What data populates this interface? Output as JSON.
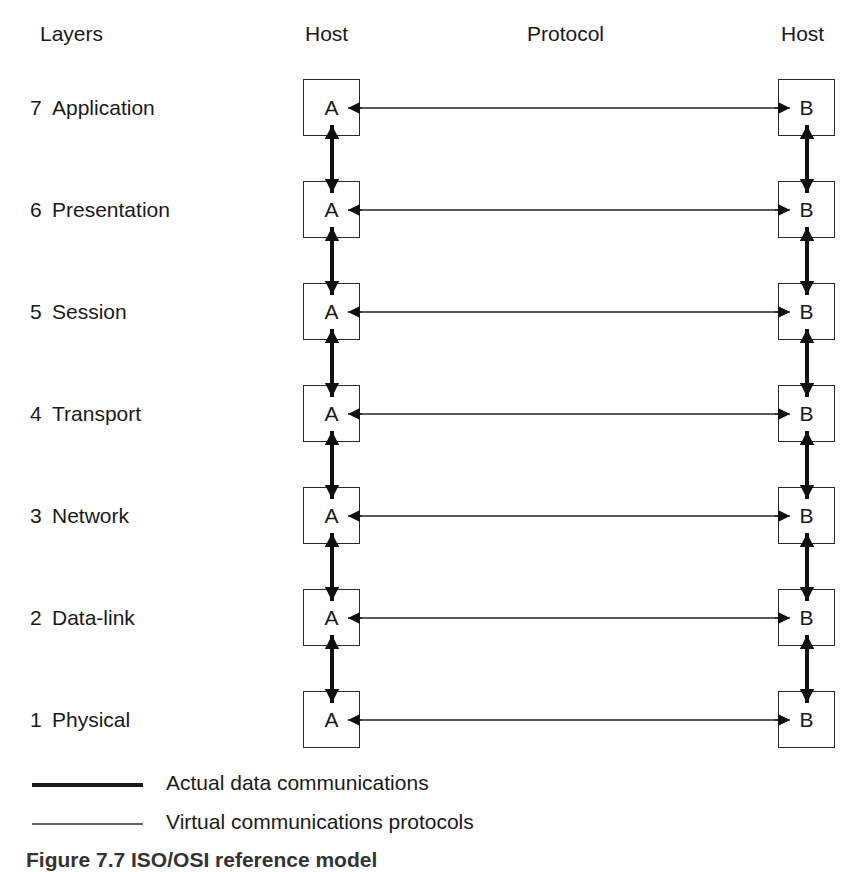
{
  "headers": {
    "layers": "Layers",
    "host_left": "Host",
    "protocol": "Protocol",
    "host_right": "Host"
  },
  "layers": [
    {
      "num": "7",
      "name": "Application",
      "left": "A",
      "right": "B"
    },
    {
      "num": "6",
      "name": "Presentation",
      "left": "A",
      "right": "B"
    },
    {
      "num": "5",
      "name": "Session",
      "left": "A",
      "right": "B"
    },
    {
      "num": "4",
      "name": "Transport",
      "left": "A",
      "right": "B"
    },
    {
      "num": "3",
      "name": "Network",
      "left": "A",
      "right": "B"
    },
    {
      "num": "2",
      "name": "Data-link",
      "left": "A",
      "right": "B"
    },
    {
      "num": "1",
      "name": "Physical",
      "left": "A",
      "right": "B"
    }
  ],
  "legend": {
    "actual": "Actual data communications",
    "virtual": "Virtual communications protocols"
  },
  "caption": "Figure 7.7 ISO/OSI reference model"
}
